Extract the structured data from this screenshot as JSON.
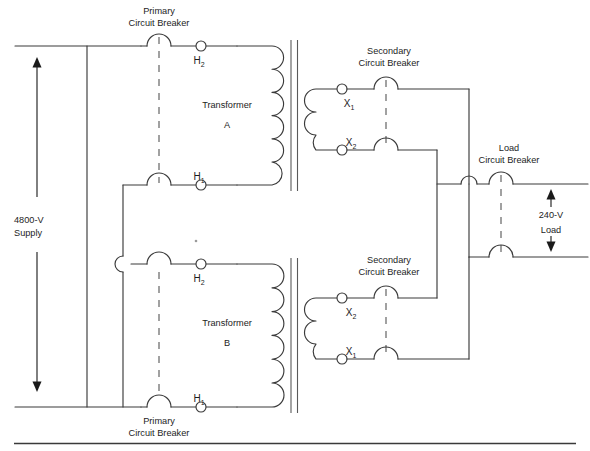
{
  "diagram": {
    "source_label_line1": "4800-V",
    "source_label_line2": "Supply",
    "load_label_line1": "240-V",
    "load_label_line2": "Load",
    "colors": {
      "wire": "#3a3a3a",
      "core": "#5a5a5a",
      "text": "#1d1d1d",
      "background": "#ffffff",
      "dash": "#555555"
    },
    "breakers": [
      {
        "id": "primary-top",
        "line1": "Primary",
        "line2": "Circuit Breaker"
      },
      {
        "id": "primary-bottom",
        "line1": "Primary",
        "line2": "Circuit Breaker"
      },
      {
        "id": "secondary-top",
        "line1": "Secondary",
        "line2": "Circuit Breaker"
      },
      {
        "id": "secondary-bottom",
        "line1": "Secondary",
        "line2": "Circuit Breaker"
      },
      {
        "id": "load",
        "line1": "Load",
        "line2": "Circuit Breaker"
      }
    ],
    "transformers": [
      {
        "id": "transformer-a",
        "name_line1": "Transformer",
        "name_line2": "A",
        "primary_terminals": [
          {
            "id": "a-h2",
            "base": "H",
            "sub": "2",
            "position": "top"
          },
          {
            "id": "a-h1",
            "base": "H",
            "sub": "1",
            "position": "bottom"
          }
        ],
        "secondary_terminals": [
          {
            "id": "a-x1",
            "base": "X",
            "sub": "1",
            "position": "top"
          },
          {
            "id": "a-x2",
            "base": "X",
            "sub": "2",
            "position": "bottom"
          }
        ]
      },
      {
        "id": "transformer-b",
        "name_line1": "Transformer",
        "name_line2": "B",
        "primary_terminals": [
          {
            "id": "b-h2",
            "base": "H",
            "sub": "2",
            "position": "top"
          },
          {
            "id": "b-h1",
            "base": "H",
            "sub": "1",
            "position": "bottom"
          }
        ],
        "secondary_terminals": [
          {
            "id": "b-x2",
            "base": "X",
            "sub": "2",
            "position": "top"
          },
          {
            "id": "b-x1",
            "base": "X",
            "sub": "1",
            "position": "bottom"
          }
        ]
      }
    ],
    "labels": {
      "primary_top_l1": "Primary",
      "primary_top_l2": "Circuit Breaker",
      "primary_bottom_l1": "Primary",
      "primary_bottom_l2": "Circuit Breaker",
      "secondary_top_l1": "Secondary",
      "secondary_top_l2": "Circuit Breaker",
      "secondary_bottom_l1": "Secondary",
      "secondary_bottom_l2": "Circuit Breaker",
      "load_cb_l1": "Load",
      "load_cb_l2": "Circuit Breaker",
      "transformer_a_l1": "Transformer",
      "transformer_a_l2": "A",
      "transformer_b_l1": "Transformer",
      "transformer_b_l2": "B",
      "supply_l1": "4800-V",
      "supply_l2": "Supply",
      "load_l1": "240-V",
      "load_l2": "Load",
      "a_h2_base": "H",
      "a_h2_sub": "2",
      "a_h1_base": "H",
      "a_h1_sub": "1",
      "a_x1_base": "X",
      "a_x1_sub": "1",
      "a_x2_base": "X",
      "a_x2_sub": "2",
      "b_h2_base": "H",
      "b_h2_sub": "2",
      "b_h1_base": "H",
      "b_h1_sub": "1",
      "b_x2_base": "X",
      "b_x2_sub": "2",
      "b_x1_base": "X",
      "b_x1_sub": "1"
    }
  }
}
